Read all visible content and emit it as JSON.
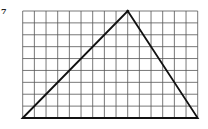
{
  "problem": {
    "number": "7"
  },
  "grid": {
    "columns": 15,
    "rows": 9,
    "left": 22.7,
    "top": 11,
    "right": 197.7,
    "bottom": 118,
    "line_color": "#555555",
    "line_width": 0.8
  },
  "triangle": {
    "vertices_grid": [
      [
        0,
        9
      ],
      [
        9,
        0
      ],
      [
        15,
        9
      ]
    ],
    "stroke_color": "#111111",
    "stroke_width": 1.8,
    "base_length_units": 15,
    "height_units": 9
  }
}
